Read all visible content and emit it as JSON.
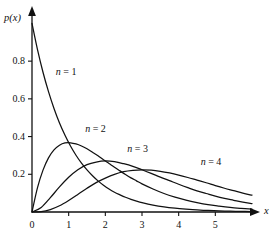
{
  "chart_data": {
    "type": "line",
    "title": "",
    "subtitle": "",
    "xlabel": "x",
    "ylabel": "p(x)",
    "xlim": [
      0,
      6.0
    ],
    "ylim": [
      0,
      1.05
    ],
    "grid": false,
    "legend_position": "inline-annotations",
    "xticks": [
      "0",
      "1",
      "2",
      "3",
      "4",
      "5"
    ],
    "xtick_values": [
      0,
      1,
      2,
      3,
      4,
      5
    ],
    "yticks": [
      "0.2",
      "0.4",
      "0.6",
      "0.8"
    ],
    "ytick_values": [
      0.2,
      0.4,
      0.6,
      0.8
    ],
    "axis_color": "#111111",
    "curve_color": "#111111",
    "background_color": "#ffffff",
    "annotations": [
      {
        "text": "n = 1",
        "n": 1,
        "x": 0.65,
        "y": 0.74
      },
      {
        "text": "n = 2",
        "n": 2,
        "x": 1.45,
        "y": 0.44
      },
      {
        "text": "n = 3",
        "n": 3,
        "x": 2.6,
        "y": 0.335
      },
      {
        "text": "n = 4",
        "n": 4,
        "x": 4.6,
        "y": 0.265
      }
    ],
    "series": [
      {
        "name": "n = 1",
        "n": 1,
        "formula": "p(x) = x^(n-1) e^(-x) / (n-1)!",
        "x": [
          0,
          0.15,
          0.3,
          0.45,
          0.6,
          0.75,
          0.9,
          1.05,
          1.2,
          1.35,
          1.5,
          1.65,
          1.8,
          1.95,
          2.1,
          2.25,
          2.4,
          2.55,
          2.7,
          2.85,
          3.0,
          3.3,
          3.6,
          3.9,
          4.2,
          4.5,
          4.8,
          5.1,
          5.4,
          5.7,
          6.0
        ],
        "values": [
          1.0,
          0.861,
          0.741,
          0.638,
          0.549,
          0.472,
          0.407,
          0.35,
          0.301,
          0.259,
          0.223,
          0.192,
          0.165,
          0.142,
          0.122,
          0.105,
          0.091,
          0.078,
          0.067,
          0.058,
          0.05,
          0.037,
          0.027,
          0.02,
          0.015,
          0.011,
          0.008,
          0.006,
          0.0045,
          0.0033,
          0.0025
        ]
      },
      {
        "name": "n = 2",
        "n": 2,
        "formula": "p(x) = x e^(-x)",
        "x": [
          0,
          0.15,
          0.3,
          0.45,
          0.6,
          0.75,
          0.9,
          1.05,
          1.2,
          1.35,
          1.5,
          1.65,
          1.8,
          1.95,
          2.1,
          2.25,
          2.4,
          2.55,
          2.7,
          2.85,
          3.0,
          3.3,
          3.6,
          3.9,
          4.2,
          4.5,
          4.8,
          5.1,
          5.4,
          5.7,
          6.0
        ],
        "values": [
          0,
          0.129,
          0.222,
          0.287,
          0.329,
          0.354,
          0.366,
          0.367,
          0.361,
          0.35,
          0.335,
          0.317,
          0.298,
          0.277,
          0.257,
          0.237,
          0.218,
          0.199,
          0.181,
          0.165,
          0.149,
          0.122,
          0.098,
          0.079,
          0.063,
          0.05,
          0.039,
          0.031,
          0.024,
          0.019,
          0.015
        ]
      },
      {
        "name": "n = 3",
        "n": 3,
        "formula": "p(x) = x^2 e^(-x) / 2",
        "x": [
          0,
          0.25,
          0.5,
          0.75,
          1.0,
          1.25,
          1.5,
          1.75,
          2.0,
          2.25,
          2.5,
          2.75,
          3.0,
          3.25,
          3.5,
          3.75,
          4.0,
          4.25,
          4.5,
          4.75,
          5.0,
          5.25,
          5.5,
          5.75,
          6.0
        ],
        "values": [
          0,
          0.024,
          0.076,
          0.133,
          0.184,
          0.224,
          0.251,
          0.265,
          0.271,
          0.267,
          0.256,
          0.242,
          0.224,
          0.205,
          0.185,
          0.166,
          0.147,
          0.129,
          0.112,
          0.098,
          0.084,
          0.072,
          0.062,
          0.052,
          0.045
        ]
      },
      {
        "name": "n = 4",
        "n": 4,
        "formula": "p(x) = x^3 e^(-x) / 6",
        "x": [
          0,
          0.25,
          0.5,
          0.75,
          1.0,
          1.25,
          1.5,
          1.75,
          2.0,
          2.25,
          2.5,
          2.75,
          3.0,
          3.25,
          3.5,
          3.75,
          4.0,
          4.25,
          4.5,
          4.75,
          5.0,
          5.25,
          5.5,
          5.75,
          6.0
        ],
        "values": [
          0,
          0.002,
          0.013,
          0.033,
          0.061,
          0.093,
          0.126,
          0.156,
          0.18,
          0.2,
          0.214,
          0.221,
          0.224,
          0.222,
          0.216,
          0.207,
          0.196,
          0.183,
          0.169,
          0.155,
          0.14,
          0.126,
          0.113,
          0.1,
          0.089
        ]
      }
    ]
  }
}
